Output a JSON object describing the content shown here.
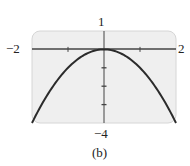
{
  "chart_data": {
    "type": "line",
    "title": "",
    "caption": "(b)",
    "xlabel": "",
    "ylabel": "",
    "xlim": [
      -2,
      2
    ],
    "ylim": [
      -4,
      1
    ],
    "x_tick_labels": {
      "min": "−2",
      "max": "2"
    },
    "y_tick_labels": {
      "max": "1",
      "min": "−4"
    },
    "x_ticks": [
      -1,
      1
    ],
    "y_ticks": [
      -1,
      -2,
      -3
    ],
    "grid": false,
    "legend": null,
    "series": [
      {
        "name": "y = -x^2",
        "x": [
          -2,
          -1.5,
          -1,
          -0.5,
          0,
          0.5,
          1,
          1.5,
          2
        ],
        "values": [
          -4,
          -2.25,
          -1,
          -0.25,
          0,
          -0.25,
          -1,
          -2.25,
          -4
        ]
      }
    ],
    "colors": {
      "background": "#efefef",
      "curve": "#2b2b2b",
      "axes": "#444444",
      "frame": "#cfcfcf"
    }
  }
}
